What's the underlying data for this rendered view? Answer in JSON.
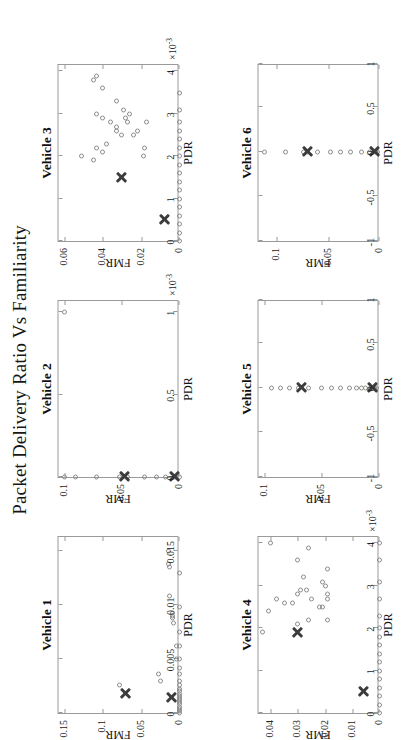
{
  "figure": {
    "title": "Packet Delivery Ratio Vs Familiarity"
  },
  "chart_data": [
    {
      "type": "scatter",
      "title": "Vehicle 1",
      "xlabel": "PDR",
      "ylabel": "FMR",
      "xlim": [
        0,
        0.0165
      ],
      "ylim": [
        0,
        0.158
      ],
      "xticks": [
        0,
        0.005,
        0.01,
        0.015
      ],
      "xticklabels": [
        "0",
        "0.005",
        "0.01",
        "0.015"
      ],
      "yticks": [
        0,
        0.05,
        0.1,
        0.15
      ],
      "yticklabels": [
        "0",
        "0.05",
        "0.1",
        "0.15"
      ],
      "x_exponent": "",
      "grid": false,
      "series": [
        {
          "name": "samples",
          "marker": "circle",
          "points": [
            [
              0.0,
              0.0
            ],
            [
              0.0002,
              0.0
            ],
            [
              0.0004,
              0.0
            ],
            [
              0.0006,
              0.0
            ],
            [
              0.0008,
              0.0
            ],
            [
              0.001,
              0.0
            ],
            [
              0.0012,
              0.0
            ],
            [
              0.0014,
              0.0
            ],
            [
              0.0016,
              0.0
            ],
            [
              0.0018,
              0.0
            ],
            [
              0.002,
              0.0
            ],
            [
              0.0022,
              0.0
            ],
            [
              0.0026,
              0.0
            ],
            [
              0.003,
              0.0
            ],
            [
              0.0036,
              0.0
            ],
            [
              0.0042,
              0.0
            ],
            [
              0.005,
              0.0
            ],
            [
              0.0062,
              0.0
            ],
            [
              0.0075,
              0.0
            ],
            [
              0.0098,
              0.0
            ],
            [
              0.013,
              0.0
            ],
            [
              0.005,
              0.0035
            ],
            [
              0.0062,
              0.004
            ],
            [
              0.0083,
              0.008
            ],
            [
              0.0088,
              0.009
            ],
            [
              0.009,
              0.0085
            ],
            [
              0.0093,
              0.0095
            ],
            [
              0.0108,
              0.0135
            ],
            [
              0.0135,
              0.013
            ],
            [
              0.0138,
              0.015
            ],
            [
              0.015,
              0.0145
            ],
            [
              0.0026,
              0.079
            ],
            [
              0.003,
              0.025
            ],
            [
              0.0036,
              0.027
            ]
          ]
        },
        {
          "name": "centroids",
          "marker": "x",
          "points": [
            [
              0.0018,
              0.07
            ],
            [
              0.0014,
              0.01
            ]
          ]
        }
      ]
    },
    {
      "type": "scatter",
      "title": "Vehicle 2",
      "xlabel": "PDR",
      "ylabel": "FMR",
      "xlim": [
        0,
        0.00108
      ],
      "ylim": [
        0,
        0.105
      ],
      "xticks": [
        0,
        0.0005,
        0.001
      ],
      "xticklabels": [
        "0",
        "0.5",
        "1"
      ],
      "yticks": [
        0,
        0.05,
        0.1
      ],
      "yticklabels": [
        "0",
        "0.05",
        "0.1"
      ],
      "x_exponent": "-3",
      "grid": false,
      "series": [
        {
          "name": "samples",
          "marker": "circle",
          "points": [
            [
              0.0,
              0.0
            ],
            [
              0.0,
              0.004
            ],
            [
              0.0,
              0.012
            ],
            [
              0.0,
              0.02
            ],
            [
              0.0,
              0.03
            ],
            [
              0.0,
              0.045
            ],
            [
              0.0,
              0.052
            ],
            [
              0.0,
              0.072
            ],
            [
              0.0,
              0.09
            ],
            [
              0.0,
              0.1
            ],
            [
              0.001,
              0.1
            ]
          ]
        },
        {
          "name": "centroids",
          "marker": "x",
          "points": [
            [
              0.0,
              0.048
            ],
            [
              0.0,
              0.004
            ]
          ]
        }
      ]
    },
    {
      "type": "scatter",
      "title": "Vehicle 3",
      "xlabel": "PDR",
      "ylabel": "FMR",
      "xlim": [
        0,
        0.0042
      ],
      "ylim": [
        0,
        0.063
      ],
      "xticks": [
        0,
        0.001,
        0.002,
        0.003,
        0.004
      ],
      "xticklabels": [
        "0",
        "1",
        "2",
        "3",
        "4"
      ],
      "yticks": [
        0,
        0.02,
        0.04,
        0.06
      ],
      "yticklabels": [
        "0",
        "0.02",
        "0.04",
        "0.06"
      ],
      "x_exponent": "-3",
      "grid": false,
      "series": [
        {
          "name": "samples",
          "marker": "circle",
          "points": [
            [
              0.0,
              0.0
            ],
            [
              0.0002,
              0.0
            ],
            [
              0.0004,
              0.0
            ],
            [
              0.0006,
              0.0
            ],
            [
              0.0008,
              0.0
            ],
            [
              0.001,
              0.0
            ],
            [
              0.0012,
              0.0
            ],
            [
              0.0014,
              0.0
            ],
            [
              0.0016,
              0.0
            ],
            [
              0.0018,
              0.0
            ],
            [
              0.002,
              0.0
            ],
            [
              0.0022,
              0.0
            ],
            [
              0.0024,
              0.0
            ],
            [
              0.0026,
              0.0
            ],
            [
              0.0028,
              0.0
            ],
            [
              0.0031,
              0.0
            ],
            [
              0.0035,
              0.0
            ],
            [
              0.0019,
              0.045
            ],
            [
              0.002,
              0.051
            ],
            [
              0.0021,
              0.04
            ],
            [
              0.0022,
              0.043
            ],
            [
              0.0023,
              0.038
            ],
            [
              0.0025,
              0.03
            ],
            [
              0.0026,
              0.033
            ],
            [
              0.0027,
              0.033
            ],
            [
              0.0028,
              0.036
            ],
            [
              0.0029,
              0.04
            ],
            [
              0.003,
              0.043
            ],
            [
              0.0025,
              0.024
            ],
            [
              0.0026,
              0.022
            ],
            [
              0.0028,
              0.027
            ],
            [
              0.0029,
              0.028
            ],
            [
              0.003,
              0.026
            ],
            [
              0.0031,
              0.029
            ],
            [
              0.0033,
              0.033
            ],
            [
              0.0036,
              0.04
            ],
            [
              0.0038,
              0.045
            ],
            [
              0.0039,
              0.043
            ],
            [
              0.002,
              0.019
            ],
            [
              0.0022,
              0.018
            ],
            [
              0.0028,
              0.017
            ]
          ]
        },
        {
          "name": "centroids",
          "marker": "x",
          "points": [
            [
              0.0015,
              0.03
            ],
            [
              0.0005,
              0.008
            ]
          ]
        }
      ]
    },
    {
      "type": "scatter",
      "title": "Vehicle 4",
      "xlabel": "PDR",
      "ylabel": "FMR",
      "xlim": [
        0,
        0.0042
      ],
      "ylim": [
        0,
        0.0445
      ],
      "xticks": [
        0,
        0.001,
        0.002,
        0.003,
        0.004
      ],
      "xticklabels": [
        "0",
        "1",
        "2",
        "3",
        "4"
      ],
      "yticks": [
        0,
        0.01,
        0.02,
        0.03,
        0.04
      ],
      "yticklabels": [
        "0",
        "0.01",
        "0.02",
        "0.03",
        "0.04"
      ],
      "x_exponent": "-3",
      "grid": false,
      "series": [
        {
          "name": "samples",
          "marker": "circle",
          "points": [
            [
              0.0,
              0.0
            ],
            [
              0.0002,
              0.0
            ],
            [
              0.0004,
              0.0
            ],
            [
              0.0006,
              0.0
            ],
            [
              0.0008,
              0.0
            ],
            [
              0.001,
              0.0
            ],
            [
              0.0012,
              0.0
            ],
            [
              0.0014,
              0.0
            ],
            [
              0.0016,
              0.0
            ],
            [
              0.0018,
              0.0
            ],
            [
              0.002,
              0.0
            ],
            [
              0.0023,
              0.0
            ],
            [
              0.0027,
              0.0
            ],
            [
              0.0031,
              0.0
            ],
            [
              0.0036,
              0.0
            ],
            [
              0.004,
              0.0
            ],
            [
              0.0019,
              0.043
            ],
            [
              0.0021,
              0.03
            ],
            [
              0.0024,
              0.041
            ],
            [
              0.0026,
              0.032
            ],
            [
              0.0027,
              0.025
            ],
            [
              0.0028,
              0.03
            ],
            [
              0.0029,
              0.027
            ],
            [
              0.003,
              0.02
            ],
            [
              0.0031,
              0.021
            ],
            [
              0.0025,
              0.021
            ],
            [
              0.0025,
              0.022
            ],
            [
              0.0022,
              0.026
            ],
            [
              0.0026,
              0.035
            ],
            [
              0.0027,
              0.038
            ],
            [
              0.0029,
              0.029
            ],
            [
              0.0032,
              0.028
            ],
            [
              0.0034,
              0.019
            ],
            [
              0.0036,
              0.03
            ],
            [
              0.0039,
              0.026
            ],
            [
              0.004,
              0.04
            ],
            [
              0.0027,
              0.019
            ],
            [
              0.0028,
              0.019
            ],
            [
              0.0022,
              0.019
            ]
          ]
        },
        {
          "name": "centroids",
          "marker": "x",
          "points": [
            [
              0.0019,
              0.03
            ],
            [
              0.0005,
              0.006
            ]
          ]
        }
      ]
    },
    {
      "type": "scatter",
      "title": "Vehicle 5",
      "xlabel": "PDR",
      "ylabel": "FMR",
      "xlim": [
        -1,
        1
      ],
      "ylim": [
        0,
        0.105
      ],
      "xticks": [
        -1,
        -0.5,
        0,
        0.5,
        1
      ],
      "xticklabels": [
        "-1",
        "-0.5",
        "0",
        "0.5",
        "1"
      ],
      "yticks": [
        0,
        0.05,
        0.1
      ],
      "yticklabels": [
        "0",
        "0.05",
        "0.1"
      ],
      "x_exponent": "",
      "grid": false,
      "series": [
        {
          "name": "samples",
          "marker": "circle",
          "points": [
            [
              0,
              0.004
            ],
            [
              0,
              0.008
            ],
            [
              0,
              0.012
            ],
            [
              0,
              0.016
            ],
            [
              0,
              0.02
            ],
            [
              0,
              0.026
            ],
            [
              0,
              0.034
            ],
            [
              0,
              0.042
            ],
            [
              0,
              0.05
            ],
            [
              0,
              0.062
            ],
            [
              0,
              0.07
            ],
            [
              0,
              0.078
            ],
            [
              0,
              0.086
            ],
            [
              0,
              0.094
            ],
            [
              0,
              0.003
            ],
            [
              0,
              0.006
            ]
          ]
        },
        {
          "name": "centroids",
          "marker": "x",
          "points": [
            [
              0,
              0.068
            ],
            [
              0,
              0.006
            ]
          ]
        }
      ]
    },
    {
      "type": "scatter",
      "title": "Vehicle 6",
      "xlabel": "PDR",
      "ylabel": "FMR",
      "xlim": [
        -1,
        1
      ],
      "ylim": [
        0,
        0.118
      ],
      "xticks": [
        -1,
        -0.5,
        0,
        0.5,
        1
      ],
      "xticklabels": [
        "-1",
        "-0.5",
        "0",
        "0.5",
        "1"
      ],
      "yticks": [
        0,
        0.05,
        0.1
      ],
      "yticklabels": [
        "0",
        "0.05",
        "0.1"
      ],
      "x_exponent": "",
      "grid": false,
      "series": [
        {
          "name": "samples",
          "marker": "circle",
          "points": [
            [
              0,
              0.004
            ],
            [
              0,
              0.01
            ],
            [
              0,
              0.018
            ],
            [
              0,
              0.028
            ],
            [
              0,
              0.038
            ],
            [
              0,
              0.048
            ],
            [
              0,
              0.06
            ],
            [
              0,
              0.07
            ],
            [
              0,
              0.074
            ],
            [
              0,
              0.092
            ],
            [
              0,
              0.112
            ],
            [
              0,
              0.002
            ]
          ]
        },
        {
          "name": "centroids",
          "marker": "x",
          "points": [
            [
              0,
              0.07
            ],
            [
              0,
              0.005
            ]
          ]
        }
      ]
    }
  ]
}
